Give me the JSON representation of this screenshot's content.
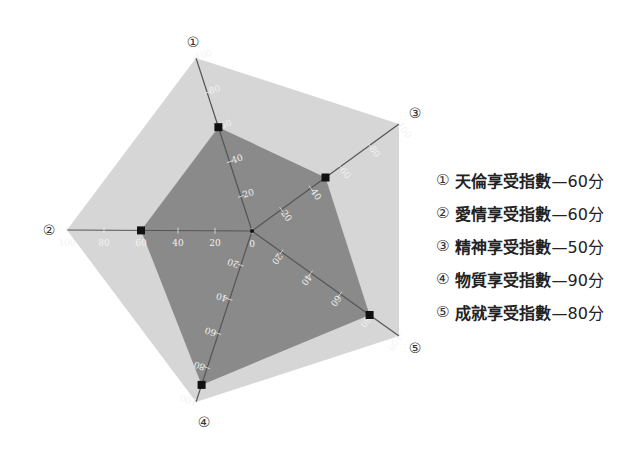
{
  "chart_data": {
    "type": "radar",
    "title": "",
    "axes": [
      "①",
      "②",
      "③",
      "④",
      "⑤"
    ],
    "categories": [
      "天倫享受指數",
      "愛情享受指數",
      "精神享受指數",
      "物質享受指數",
      "成就享受指數"
    ],
    "values": [
      60,
      60,
      50,
      90,
      80
    ],
    "range": [
      0,
      100
    ],
    "ticks": [
      0,
      20,
      40,
      60,
      80,
      100
    ],
    "colors": {
      "outer_fill": "#d6d6d6",
      "inner_fill": "#8a8a8a",
      "axis": "#555555",
      "marker": "#111111"
    }
  },
  "legend": {
    "items": [
      {
        "num": "①",
        "label": "天倫享受指數",
        "value": "—60分"
      },
      {
        "num": "②",
        "label": "愛情享受指數",
        "value": "—60分"
      },
      {
        "num": "③",
        "label": "精神享受指數",
        "value": "—50分"
      },
      {
        "num": "④",
        "label": "物質享受指數",
        "value": "—90分"
      },
      {
        "num": "⑤",
        "label": "成就享受指數",
        "value": "—80分"
      }
    ]
  }
}
